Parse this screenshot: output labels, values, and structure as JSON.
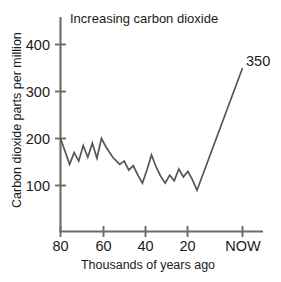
{
  "chart_data": {
    "type": "line",
    "title": "Increasing carbon dioxide",
    "xlabel": "Thousands of years ago",
    "ylabel": "Carbon dioxide parts per million",
    "xlim": [
      80,
      -6
    ],
    "ylim": [
      0,
      430
    ],
    "x_ticks": [
      {
        "value": 80,
        "label": "80"
      },
      {
        "value": 60,
        "label": "60"
      },
      {
        "value": 40,
        "label": "40"
      },
      {
        "value": 20,
        "label": "20"
      },
      {
        "value": 0,
        "label": "NOW"
      }
    ],
    "y_ticks": [
      {
        "value": 100,
        "label": "100"
      },
      {
        "value": 200,
        "label": "200"
      },
      {
        "value": 300,
        "label": "300"
      },
      {
        "value": 400,
        "label": "400"
      }
    ],
    "grid": false,
    "legend": false,
    "annotations": [
      {
        "text": "350",
        "x": 0,
        "y": 350,
        "position": "above-right"
      }
    ],
    "series": [
      {
        "name": "Carbon dioxide concentration",
        "color": "#555555",
        "x": [
          80,
          78,
          76,
          74,
          72,
          70,
          68,
          66,
          64,
          62,
          60,
          57,
          54,
          52,
          50,
          48,
          46,
          44,
          42,
          40,
          38,
          36,
          34,
          32,
          30,
          28,
          26,
          24,
          22,
          20,
          0
        ],
        "values": [
          200,
          173,
          145,
          170,
          152,
          185,
          160,
          190,
          158,
          200,
          182,
          160,
          145,
          152,
          133,
          142,
          122,
          105,
          133,
          165,
          140,
          120,
          105,
          122,
          110,
          135,
          118,
          130,
          112,
          90,
          350
        ]
      }
    ]
  },
  "figure": {
    "background_color": "#ffffff",
    "line_color": "#555555",
    "axis_color": "#6b6b6b",
    "text_color": "#1a1a1a"
  }
}
